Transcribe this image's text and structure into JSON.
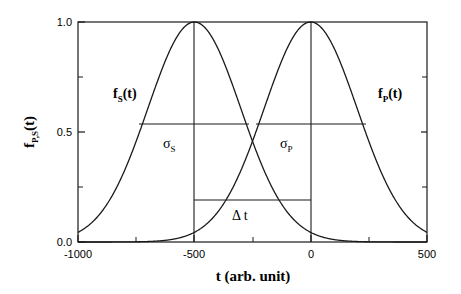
{
  "chart_data": {
    "type": "line",
    "title": "",
    "xlabel": "t (arb. unit)",
    "ylabel": "f_P,S(t)",
    "xlim": [
      -1000,
      500
    ],
    "ylim": [
      0.0,
      1.0
    ],
    "grid": false,
    "legend_position": "inline-annotations",
    "xticks": [
      -1000,
      -500,
      0,
      500
    ],
    "xtick_labels": [
      "-1000",
      "-500",
      "0",
      "500"
    ],
    "xminor_ticks": [
      -750,
      -250,
      250
    ],
    "yticks": [
      0.0,
      0.5,
      1.0
    ],
    "ytick_labels": [
      "0.0",
      "0.5",
      "1.0"
    ],
    "yminor_ticks": [
      0.25,
      0.75
    ],
    "series": [
      {
        "name": "f_S(t)",
        "shape": "gaussian",
        "center": -500,
        "amplitude": 1.0,
        "sigma": 200,
        "fwhm": 470,
        "label_x": -790,
        "label_y": 0.72
      },
      {
        "name": "f_P(t)",
        "shape": "gaussian",
        "center": 0,
        "amplitude": 1.0,
        "sigma": 200,
        "fwhm": 470,
        "label_x": 170,
        "label_y": 0.72
      }
    ],
    "annotations": [
      {
        "name": "sigma_S",
        "label": "σ",
        "sub": "S",
        "y": 0.5,
        "x_start": -735,
        "x_end": -265,
        "label_x": -600,
        "label_y": 0.42
      },
      {
        "name": "sigma_P",
        "label": "σ",
        "sub": "P",
        "y": 0.5,
        "x_start": -235,
        "x_end": 235,
        "label_x": -100,
        "label_y": 0.42
      },
      {
        "name": "delta_t",
        "label": "Δ t",
        "y": 0.195,
        "x_start": -500,
        "x_end": 0,
        "label_x": -250,
        "label_y": 0.12
      }
    ],
    "vertical_markers": [
      -500,
      0
    ]
  },
  "axis": {
    "x_label": "t (arb. unit)",
    "y_label_parts": {
      "f": "f",
      "sub": "P,S",
      "rest": "(t)"
    }
  },
  "labels": {
    "f_s": {
      "f": "f",
      "sub": "S",
      "rest": "(t)"
    },
    "f_p": {
      "f": "f",
      "sub": "P",
      "rest": "(t)"
    },
    "sigma_s": {
      "sym": "σ",
      "sub": "S"
    },
    "sigma_p": {
      "sym": "σ",
      "sub": "P"
    },
    "delta_t": "Δ t"
  },
  "ticks": {
    "x": [
      "-1000",
      "-500",
      "0",
      "500"
    ],
    "y": [
      "1.0",
      "0.5",
      "0.0"
    ]
  },
  "colors": {
    "axis": "#1a1a1a",
    "curve": "#1a1a1a",
    "background": "#ffffff"
  }
}
